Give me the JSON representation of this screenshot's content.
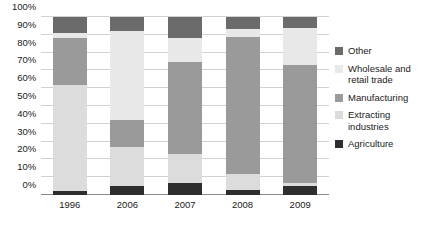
{
  "chart_data": {
    "type": "bar",
    "subtype": "stacked-percentage-column",
    "title": "",
    "subtitle": "",
    "xlabel": "",
    "ylabel": "",
    "categories": [
      "1996",
      "2006",
      "2007",
      "2008",
      "2009"
    ],
    "ylim": [
      0,
      100
    ],
    "yticks": [
      "0%",
      "10%",
      "20%",
      "30%",
      "40%",
      "50%",
      "60%",
      "70%",
      "80%",
      "90%",
      "100%"
    ],
    "ytick_values": [
      0,
      10,
      20,
      30,
      40,
      50,
      60,
      70,
      80,
      90,
      100
    ],
    "grid": true,
    "legend_position": "right",
    "stack_order_bottom_to_top": [
      "Agriculture",
      "Extracting industries",
      "Manufacturing",
      "Wholesale and retail trade",
      "Other"
    ],
    "series": [
      {
        "name": "Agriculture",
        "color": "#2e2e2e",
        "values": [
          2,
          5,
          7,
          3,
          5
        ]
      },
      {
        "name": "Extracting industries",
        "color": "#dcdcdc",
        "values": [
          60,
          22,
          16,
          9,
          2
        ]
      },
      {
        "name": "Manufacturing",
        "color": "#9a9a9a",
        "values": [
          26,
          15,
          52,
          77,
          66
        ]
      },
      {
        "name": "Wholesale and retail trade",
        "color": "#e8e8e8",
        "values": [
          3,
          50,
          13,
          4,
          21
        ]
      },
      {
        "name": "Other",
        "color": "#6b6b6b",
        "values": [
          9,
          8,
          12,
          7,
          6
        ]
      }
    ],
    "colors": {
      "other": "#6b6b6b",
      "wholesale_and_retail_trade": "#e8e8e8",
      "manufacturing": "#9a9a9a",
      "extracting_industries": "#dcdcdc",
      "agriculture": "#2e2e2e",
      "gridline": "#d2d2d2",
      "axis": "#8a8a8a",
      "text": "#1a1a1a",
      "background": "#ffffff"
    }
  },
  "legend": {
    "items": [
      {
        "label": "Other",
        "color": "#6b6b6b"
      },
      {
        "label": "Wholesale and\nretail trade",
        "color": "#e8e8e8"
      },
      {
        "label": "Manufacturing",
        "color": "#9a9a9a"
      },
      {
        "label": "Extracting\nindustries",
        "color": "#dcdcdc"
      },
      {
        "label": "Agriculture",
        "color": "#2e2e2e"
      }
    ]
  }
}
